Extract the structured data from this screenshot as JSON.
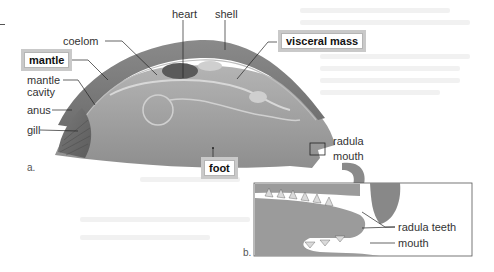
{
  "figure": {
    "panel_a": {
      "tag": "a.",
      "labels": {
        "heart": "heart",
        "shell": "shell",
        "coelom": "coelom",
        "mantle": "mantle",
        "mantle_cavity_1": "mantle",
        "mantle_cavity_2": "cavity",
        "anus": "anus",
        "gill": "gill",
        "visceral_mass": "visceral mass",
        "radula": "radula",
        "mouth": "mouth",
        "foot": "foot"
      }
    },
    "panel_b": {
      "tag": "b.",
      "labels": {
        "radula_teeth": "radula teeth",
        "mouth": "mouth"
      }
    },
    "colors": {
      "body": "#9a9a9a",
      "shell": "#7d7d7d",
      "highlight_box_border": "#c9c9c9",
      "label_text": "#333333"
    }
  }
}
